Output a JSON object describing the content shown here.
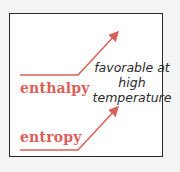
{
  "diagram": {
    "labels": {
      "enthalpy": "enthalpy",
      "entropy": "entropy"
    },
    "note": {
      "line1": "favorable at",
      "line2": "high",
      "line3": "temperature"
    },
    "colors": {
      "accent": "#d9615a",
      "border": "#2a2a2a",
      "text": "#2a2a2a"
    }
  }
}
